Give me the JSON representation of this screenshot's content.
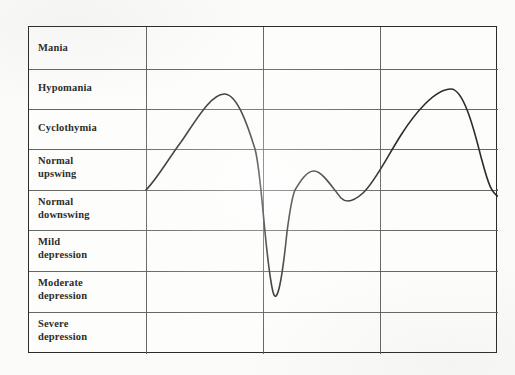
{
  "document": {
    "kind": "mood-spectrum-chart",
    "background_color": "#fbfbf9",
    "ink_color": "#2d2d2b"
  },
  "chart": {
    "frame": {
      "x": 28,
      "y": 26,
      "width": 469,
      "height": 327,
      "border_color": "#2b2b2b",
      "grid_color": "#5a5a58",
      "grid": true
    },
    "label_column_width": 117,
    "row_labels": [
      "Mania",
      "Hypomania",
      "Cyclothymia",
      "Normal\nupswing",
      "Normal\ndownswing",
      "Mild\ndepression",
      "Moderate\ndepression",
      "Severe\ndepression"
    ],
    "row_boundaries_y": [
      0,
      42,
      82,
      122,
      163,
      203,
      244,
      285,
      327
    ],
    "column_dividers_x": [
      117,
      234,
      351
    ],
    "baseline_y": 163
  },
  "chart_data": {
    "type": "line",
    "title": "",
    "xlabel": "",
    "ylabel": "",
    "legend": [],
    "grid": true,
    "y_categories": [
      "Mania",
      "Hypomania",
      "Cyclothymia",
      "Normal upswing",
      "Normal downswing",
      "Mild depression",
      "Moderate depression",
      "Severe depression"
    ],
    "y_band_centers": [
      0.5,
      1.5,
      2.5,
      3.5,
      4.5,
      5.5,
      6.5,
      7.5
    ],
    "baseline_band_boundary": "Normal upswing / Normal downswing",
    "series": [
      {
        "name": "mood",
        "color": "#2b2b2b",
        "line_width": 1.6,
        "points": [
          {
            "x": 117,
            "y": 163,
            "label": "start at baseline"
          },
          {
            "x": 140,
            "y": 140
          },
          {
            "x": 160,
            "y": 110
          },
          {
            "x": 178,
            "y": 82
          },
          {
            "x": 196,
            "y": 67,
            "label": "peak 1 (hypomania)"
          },
          {
            "x": 212,
            "y": 80
          },
          {
            "x": 226,
            "y": 122
          },
          {
            "x": 236,
            "y": 200
          },
          {
            "x": 244,
            "y": 265,
            "label": "trough 1 (moderate depression)"
          },
          {
            "x": 252,
            "y": 248
          },
          {
            "x": 258,
            "y": 205
          },
          {
            "x": 266,
            "y": 163
          },
          {
            "x": 276,
            "y": 152
          },
          {
            "x": 285,
            "y": 144,
            "label": "peak 2 (normal upswing)"
          },
          {
            "x": 298,
            "y": 156
          },
          {
            "x": 310,
            "y": 170
          },
          {
            "x": 320,
            "y": 174,
            "label": "dip (normal downswing)"
          },
          {
            "x": 334,
            "y": 166
          },
          {
            "x": 352,
            "y": 140
          },
          {
            "x": 372,
            "y": 108
          },
          {
            "x": 396,
            "y": 74
          },
          {
            "x": 422,
            "y": 62,
            "label": "peak 3 (hypomania)"
          },
          {
            "x": 438,
            "y": 80
          },
          {
            "x": 450,
            "y": 122
          },
          {
            "x": 458,
            "y": 155
          },
          {
            "x": 466,
            "y": 168
          },
          {
            "x": 478,
            "y": 170,
            "label": "flatten below baseline"
          },
          {
            "x": 488,
            "y": 165
          },
          {
            "x": 469,
            "y": 163,
            "label": "end at baseline"
          }
        ]
      }
    ],
    "path": "M 117 163 C 128 152 140 131 152 115 C 166 95 182 66 196 67 C 208 68 218 96 226 122 C 233 147 236 232 244 265 C 248 280 253 254 258 205 C 261 182 263 170 266 163 C 272 153 278 144 285 144 C 293 144 303 160 312 171 C 317 176 324 175 334 166 C 346 155 358 130 372 108 C 386 86 406 62 422 62 C 434 62 444 98 452 130 C 458 152 462 169 472 170 C 480 171 486 165 469 163"
  }
}
